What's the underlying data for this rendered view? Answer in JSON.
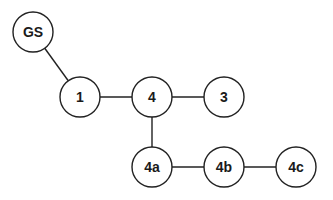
{
  "diagram": {
    "type": "tree",
    "nodes": [
      {
        "id": "GS",
        "label": "GS",
        "x": 33,
        "y": 32
      },
      {
        "id": "1",
        "label": "1",
        "x": 80,
        "y": 97
      },
      {
        "id": "4",
        "label": "4",
        "x": 152,
        "y": 97
      },
      {
        "id": "3",
        "label": "3",
        "x": 224,
        "y": 97
      },
      {
        "id": "4a",
        "label": "4a",
        "x": 152,
        "y": 167
      },
      {
        "id": "4b",
        "label": "4b",
        "x": 224,
        "y": 167
      },
      {
        "id": "4c",
        "label": "4c",
        "x": 296,
        "y": 167
      }
    ],
    "edges": [
      {
        "from": "GS",
        "to": "1"
      },
      {
        "from": "1",
        "to": "4"
      },
      {
        "from": "4",
        "to": "3"
      },
      {
        "from": "4",
        "to": "4a"
      },
      {
        "from": "4a",
        "to": "4b"
      },
      {
        "from": "4b",
        "to": "4c"
      }
    ],
    "node_radius": 20,
    "colors": {
      "stroke": "#222222",
      "fill": "#ffffff",
      "text": "#1a1a1a"
    }
  }
}
